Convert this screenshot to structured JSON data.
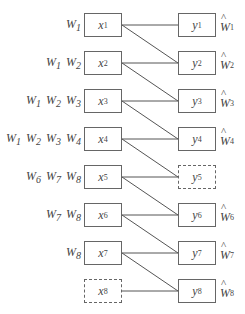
{
  "diagram": {
    "layout": {
      "row_top_start": 13,
      "row_spacing": 38,
      "box_height": 24,
      "box_width": 38,
      "left_column_x": 84,
      "right_column_x": 178
    },
    "left_nodes": [
      {
        "var": "x",
        "sub": "1",
        "dashed": false,
        "labels": [
          {
            "var": "W",
            "sub": "1"
          }
        ]
      },
      {
        "var": "x",
        "sub": "2",
        "dashed": false,
        "labels": [
          {
            "var": "W",
            "sub": "1"
          },
          {
            "var": "W",
            "sub": "2"
          }
        ]
      },
      {
        "var": "x",
        "sub": "3",
        "dashed": false,
        "labels": [
          {
            "var": "W",
            "sub": "1"
          },
          {
            "var": "W",
            "sub": "2"
          },
          {
            "var": "W",
            "sub": "3"
          }
        ]
      },
      {
        "var": "x",
        "sub": "4",
        "dashed": false,
        "labels": [
          {
            "var": "W",
            "sub": "1"
          },
          {
            "var": "W",
            "sub": "2"
          },
          {
            "var": "W",
            "sub": "3"
          },
          {
            "var": "W",
            "sub": "4"
          }
        ]
      },
      {
        "var": "x",
        "sub": "5",
        "dashed": false,
        "labels": [
          {
            "var": "W",
            "sub": "6"
          },
          {
            "var": "W",
            "sub": "7"
          },
          {
            "var": "W",
            "sub": "8"
          }
        ]
      },
      {
        "var": "x",
        "sub": "6",
        "dashed": false,
        "labels": [
          {
            "var": "W",
            "sub": "7"
          },
          {
            "var": "W",
            "sub": "8"
          }
        ]
      },
      {
        "var": "x",
        "sub": "7",
        "dashed": false,
        "labels": [
          {
            "var": "W",
            "sub": "8"
          }
        ]
      },
      {
        "var": "x",
        "sub": "8",
        "dashed": true,
        "labels": []
      }
    ],
    "right_nodes": [
      {
        "var": "y",
        "sub": "1",
        "dashed": false,
        "hat_label": {
          "var": "W",
          "sub": "1"
        }
      },
      {
        "var": "y",
        "sub": "2",
        "dashed": false,
        "hat_label": {
          "var": "W",
          "sub": "2"
        }
      },
      {
        "var": "y",
        "sub": "3",
        "dashed": false,
        "hat_label": {
          "var": "W",
          "sub": "3"
        }
      },
      {
        "var": "y",
        "sub": "4",
        "dashed": false,
        "hat_label": {
          "var": "W",
          "sub": "4"
        }
      },
      {
        "var": "y",
        "sub": "5",
        "dashed": true,
        "hat_label": null
      },
      {
        "var": "y",
        "sub": "6",
        "dashed": false,
        "hat_label": {
          "var": "W",
          "sub": "6"
        }
      },
      {
        "var": "y",
        "sub": "7",
        "dashed": false,
        "hat_label": {
          "var": "W",
          "sub": "7"
        }
      },
      {
        "var": "y",
        "sub": "8",
        "dashed": false,
        "hat_label": {
          "var": "W",
          "sub": "8"
        }
      }
    ],
    "edges": [
      [
        1,
        1
      ],
      [
        1,
        2
      ],
      [
        2,
        2
      ],
      [
        2,
        3
      ],
      [
        3,
        3
      ],
      [
        3,
        4
      ],
      [
        4,
        4
      ],
      [
        4,
        5
      ],
      [
        5,
        5
      ],
      [
        5,
        6
      ],
      [
        6,
        6
      ],
      [
        6,
        7
      ],
      [
        7,
        7
      ],
      [
        7,
        8
      ],
      [
        8,
        8
      ]
    ],
    "colors": {
      "line": "#555555",
      "border": "#666666",
      "text": "#444444"
    }
  }
}
